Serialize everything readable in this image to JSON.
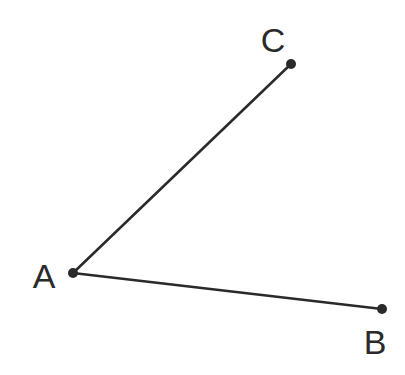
{
  "diagram": {
    "type": "angle",
    "vertex": "A",
    "points": [
      {
        "id": "A",
        "label": "A",
        "x": 73,
        "y": 273,
        "label_x": 44,
        "label_y": 288
      },
      {
        "id": "B",
        "label": "B",
        "x": 382,
        "y": 309,
        "label_x": 375,
        "label_y": 354
      },
      {
        "id": "C",
        "label": "C",
        "x": 291,
        "y": 64,
        "label_x": 273,
        "label_y": 52
      }
    ],
    "segments": [
      {
        "from": "A",
        "to": "C"
      },
      {
        "from": "A",
        "to": "B"
      }
    ],
    "stroke_color": "#2a2a2a",
    "background": "#ffffff"
  }
}
